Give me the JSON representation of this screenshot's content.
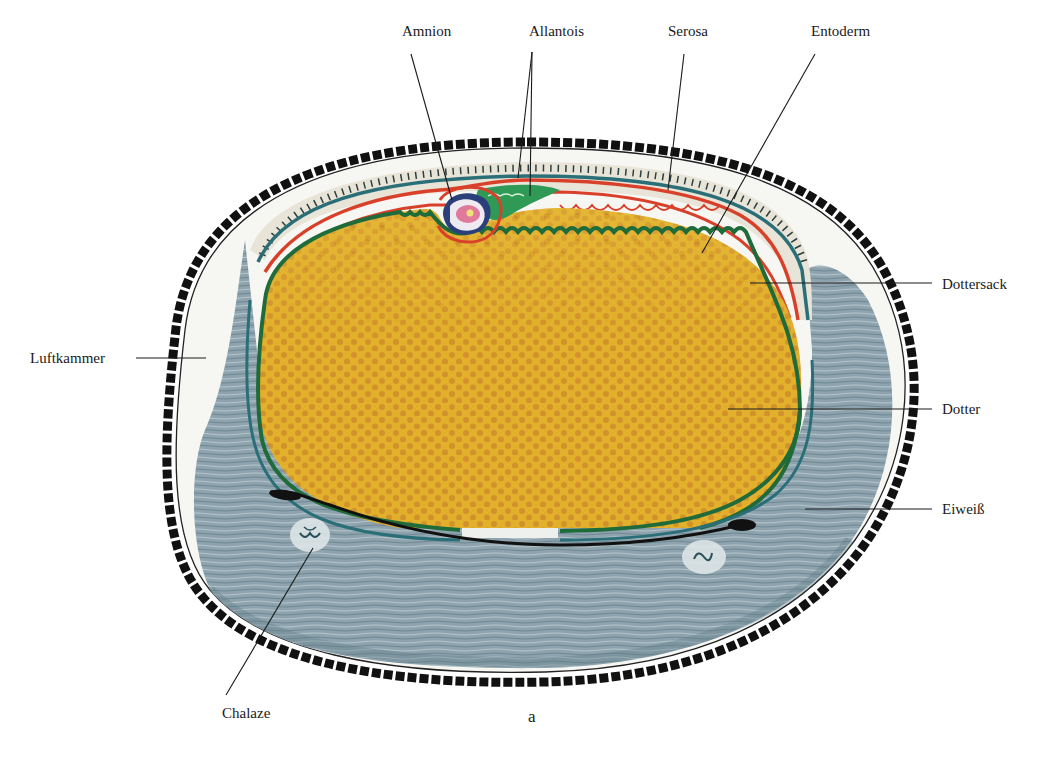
{
  "figure": {
    "panel_label": "a",
    "colors": {
      "shell": "#111111",
      "shell_membrane": "#ffffff",
      "albumen": "#8ea3ad",
      "albumen_dark": "#5f7c88",
      "air_chamber": "#f6f6f2",
      "serosa_zone": "#e9e4d8",
      "yolk": "#e2b02a",
      "yolk_dots": "#c7822a",
      "entoderm_green": "#1f6b3a",
      "vitelline_teal": "#2a6f78",
      "serosa_red": "#d9402a",
      "allantois_green": "#2e9a55",
      "amnion_blue": "#2b3f7a",
      "embryo_pink": "#e07a9a"
    }
  },
  "labels": [
    {
      "id": "amnion",
      "text": "Amnion",
      "x": 402,
      "y": 24,
      "line": [
        [
          411,
          54
        ],
        [
          452,
          200
        ]
      ]
    },
    {
      "id": "allantois",
      "text": "Allantois",
      "x": 529,
      "y": 24,
      "line_a": [
        [
          532,
          52
        ],
        [
          518,
          178
        ]
      ],
      "line_b": [
        [
          532,
          52
        ],
        [
          530,
          196
        ]
      ]
    },
    {
      "id": "serosa",
      "text": "Serosa",
      "x": 668,
      "y": 24,
      "line": [
        [
          684,
          54
        ],
        [
          668,
          190
        ]
      ]
    },
    {
      "id": "entoderm",
      "text": "Entoderm",
      "x": 811,
      "y": 24,
      "line": [
        [
          815,
          54
        ],
        [
          702,
          253
        ]
      ]
    },
    {
      "id": "dottersack",
      "text": "Dottersack",
      "x": 942,
      "y": 278,
      "line": [
        [
          932,
          283
        ],
        [
          750,
          283
        ]
      ]
    },
    {
      "id": "luftkammer",
      "text": "Luftkammer",
      "x": 30,
      "y": 350,
      "line": [
        [
          136,
          358
        ],
        [
          206,
          358
        ]
      ]
    },
    {
      "id": "dotter",
      "text": "Dotter",
      "x": 942,
      "y": 402,
      "line": [
        [
          932,
          409
        ],
        [
          728,
          409
        ]
      ]
    },
    {
      "id": "eiweiss",
      "text": "Eiweiß",
      "x": 942,
      "y": 503,
      "line": [
        [
          932,
          509
        ],
        [
          805,
          509
        ]
      ]
    },
    {
      "id": "chalaze",
      "text": "Chalaze",
      "x": 222,
      "y": 707,
      "line": [
        [
          226,
          695
        ],
        [
          313,
          548
        ]
      ]
    }
  ]
}
